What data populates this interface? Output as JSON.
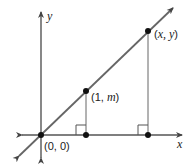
{
  "diagram": {
    "axes": {
      "x_label": "x",
      "y_label": "y"
    },
    "points": [
      {
        "label_pre": "(0, 0)",
        "italic": "",
        "label_post": "",
        "px": 41,
        "py": 135
      },
      {
        "label_pre": "(1, ",
        "italic": "m",
        "label_post": ")",
        "px": 86,
        "py": 91
      },
      {
        "label_pre": "(",
        "italic": "x, y",
        "label_post": ")",
        "px": 148,
        "py": 31
      }
    ],
    "colors": {
      "line": "#555555",
      "point": "#111111"
    },
    "labels": {
      "origin": "(0, 0)",
      "p1_open": "(1, ",
      "p1_var": "m",
      "p1_close": ")",
      "p2_open": "(",
      "p2_var": "x, y",
      "p2_close": ")"
    }
  }
}
